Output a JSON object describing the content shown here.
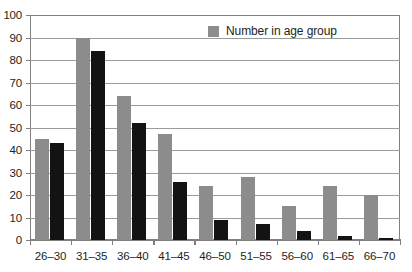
{
  "chart_data": {
    "type": "bar",
    "title": "",
    "xlabel": "",
    "ylabel": "",
    "ylim": [
      0,
      100
    ],
    "yticks": [
      0,
      10,
      20,
      30,
      40,
      50,
      60,
      70,
      80,
      90,
      100
    ],
    "grid": true,
    "legend_position": "top-center",
    "categories": [
      "26–30",
      "31–35",
      "36–40",
      "41–45",
      "46–50",
      "51–55",
      "56–60",
      "61–65",
      "66–70"
    ],
    "series": [
      {
        "name": "Number in age group",
        "color": "#8c8c8c",
        "values": [
          45,
          90,
          64,
          47,
          24,
          28,
          15,
          24,
          20
        ]
      },
      {
        "name": "",
        "color": "#131313",
        "values": [
          43,
          84,
          52,
          26,
          9,
          7,
          4,
          2,
          1
        ]
      }
    ]
  },
  "legend": {
    "items": [
      {
        "label": "Number in age group",
        "color": "#8c8c8c"
      }
    ]
  },
  "axis": {
    "y_labels": [
      "100",
      "90",
      "80",
      "70",
      "60",
      "50",
      "40",
      "30",
      "20",
      "10",
      "0"
    ],
    "x_labels": [
      "26–30",
      "31–35",
      "36–40",
      "41–45",
      "46–50",
      "51–55",
      "56–60",
      "61–65",
      "66–70"
    ]
  },
  "colors": {
    "series_gray": "#8c8c8c",
    "series_black": "#131313",
    "axis": "#808080",
    "gridline": "#9a9a9a",
    "text": "#231f20"
  }
}
